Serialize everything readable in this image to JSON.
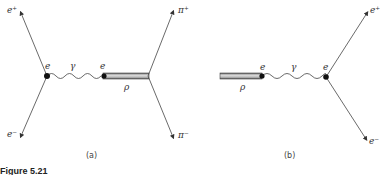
{
  "figure": {
    "caption": "Figure 5.21",
    "panels": [
      {
        "id": "a",
        "label": "(a)",
        "labels": {
          "e_plus": "e⁺",
          "e_minus": "e⁻",
          "vertex_left": "e",
          "vertex_right": "e",
          "photon": "γ",
          "rho": "ρ",
          "pi_plus": "π⁺",
          "pi_minus": "π⁻"
        }
      },
      {
        "id": "b",
        "label": "(b)",
        "labels": {
          "rho": "ρ",
          "vertex_left": "e",
          "vertex_right": "e",
          "photon": "γ",
          "e_plus": "e⁺",
          "e_minus": "e⁻"
        }
      }
    ]
  }
}
